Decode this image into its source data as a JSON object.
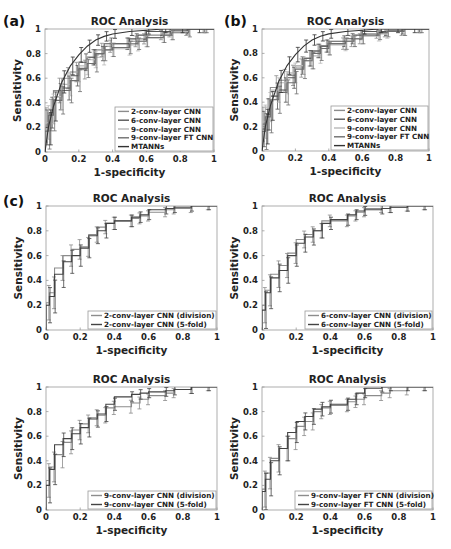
{
  "figure": {
    "panel_labels": [
      "(a)",
      "(b)",
      "(c)"
    ]
  },
  "chart_data": [
    {
      "id": "a",
      "panel_label": "(a)",
      "type": "line",
      "title": "ROC Analysis",
      "xlabel": "1-specificity",
      "ylabel": "Sensitivity",
      "xlim": [
        0,
        1
      ],
      "ylim": [
        0,
        1
      ],
      "xticks": [
        "0",
        "0.2",
        "0.4",
        "0.6",
        "0.8",
        "1"
      ],
      "yticks": [
        "0",
        "0.2",
        "0.4",
        "0.6",
        "0.8",
        "1"
      ],
      "grid": false,
      "legend_position": "lower right",
      "frame": {
        "x0": 45,
        "y0": 29,
        "x1": 214,
        "y1": 152
      },
      "legend_box": {
        "x": 115,
        "y": 107,
        "w": 98,
        "h": 44
      },
      "series": [
        {
          "name": "2-conv-layer CNN",
          "color": "#8c8c8c",
          "step": true,
          "x": [
            0,
            0.02,
            0.05,
            0.1,
            0.15,
            0.2,
            0.25,
            0.3,
            0.35,
            0.4,
            0.5,
            0.55,
            0.6,
            0.7,
            0.75,
            0.85,
            0.95,
            1
          ],
          "y": [
            0,
            0.22,
            0.3,
            0.5,
            0.6,
            0.65,
            0.67,
            0.77,
            0.83,
            0.86,
            0.88,
            0.9,
            0.92,
            0.95,
            0.97,
            0.98,
            1,
            1
          ]
        },
        {
          "name": "6-conv-layer CNN",
          "color": "#555555",
          "step": true,
          "x": [
            0,
            0.02,
            0.05,
            0.1,
            0.15,
            0.2,
            0.25,
            0.3,
            0.35,
            0.4,
            0.5,
            0.55,
            0.6,
            0.7,
            0.75,
            0.85,
            0.95,
            1
          ],
          "y": [
            0,
            0.2,
            0.32,
            0.45,
            0.52,
            0.62,
            0.73,
            0.77,
            0.8,
            0.88,
            0.88,
            0.92,
            0.95,
            0.98,
            0.98,
            0.99,
            1,
            1
          ]
        },
        {
          "name": "9-conv-layer CNN",
          "color": "#b8b8b8",
          "step": true,
          "x": [
            0,
            0.02,
            0.05,
            0.1,
            0.15,
            0.2,
            0.25,
            0.3,
            0.35,
            0.4,
            0.5,
            0.55,
            0.6,
            0.7,
            0.75,
            0.85,
            0.95,
            1
          ],
          "y": [
            0,
            0.24,
            0.35,
            0.45,
            0.55,
            0.65,
            0.7,
            0.75,
            0.77,
            0.83,
            0.84,
            0.87,
            0.9,
            0.93,
            0.95,
            0.98,
            1,
            1
          ]
        },
        {
          "name": "9-conv-layer FT CNN",
          "color": "#6e6e6e",
          "step": true,
          "x": [
            0,
            0.02,
            0.05,
            0.1,
            0.15,
            0.2,
            0.25,
            0.3,
            0.35,
            0.4,
            0.5,
            0.55,
            0.6,
            0.7,
            0.75,
            0.85,
            0.95,
            1
          ],
          "y": [
            0,
            0.17,
            0.3,
            0.42,
            0.5,
            0.58,
            0.68,
            0.72,
            0.8,
            0.83,
            0.85,
            0.88,
            0.9,
            0.93,
            0.95,
            0.97,
            1,
            1
          ]
        },
        {
          "name": "MTANNs",
          "color": "#333333",
          "step": false,
          "x": [
            0,
            0.02,
            0.05,
            0.1,
            0.15,
            0.2,
            0.25,
            0.3,
            0.35,
            0.4,
            0.5,
            0.6,
            0.7,
            0.8,
            0.9,
            1
          ],
          "y": [
            0,
            0.2,
            0.37,
            0.57,
            0.7,
            0.79,
            0.86,
            0.91,
            0.94,
            0.96,
            0.98,
            0.99,
            1,
            1,
            1,
            1
          ]
        }
      ]
    },
    {
      "id": "b",
      "panel_label": "(b)",
      "type": "line",
      "title": "ROC Analysis",
      "xlabel": "1-specificity",
      "ylabel": "Sensitivity",
      "xlim": [
        0,
        1
      ],
      "ylim": [
        0,
        1
      ],
      "xticks": [
        "0",
        "0.2",
        "0.4",
        "0.6",
        "0.8",
        "1"
      ],
      "yticks": [
        "0",
        "0.2",
        "0.4",
        "0.6",
        "0.8",
        "1"
      ],
      "grid": false,
      "legend_position": "lower right",
      "frame": {
        "x0": 262,
        "y0": 29,
        "x1": 429,
        "y1": 151
      },
      "legend_box": {
        "x": 331,
        "y": 106,
        "w": 97,
        "h": 44
      },
      "series": [
        {
          "name": "2-conv-layer CNN",
          "color": "#8c8c8c",
          "step": true,
          "x": [
            0,
            0.02,
            0.05,
            0.1,
            0.15,
            0.2,
            0.25,
            0.3,
            0.35,
            0.4,
            0.5,
            0.55,
            0.6,
            0.7,
            0.75,
            0.85,
            0.95,
            1
          ],
          "y": [
            0,
            0.22,
            0.3,
            0.52,
            0.58,
            0.62,
            0.68,
            0.76,
            0.82,
            0.86,
            0.88,
            0.9,
            0.92,
            0.96,
            0.97,
            0.98,
            1,
            1
          ]
        },
        {
          "name": "6-conv-layer CNN",
          "color": "#555555",
          "step": true,
          "x": [
            0,
            0.02,
            0.05,
            0.1,
            0.15,
            0.2,
            0.25,
            0.3,
            0.35,
            0.4,
            0.5,
            0.55,
            0.6,
            0.7,
            0.75,
            0.85,
            0.95,
            1
          ],
          "y": [
            0,
            0.18,
            0.3,
            0.45,
            0.5,
            0.6,
            0.7,
            0.76,
            0.82,
            0.86,
            0.9,
            0.92,
            0.95,
            0.98,
            0.98,
            0.99,
            1,
            1
          ]
        },
        {
          "name": "9-conv-layer CNN",
          "color": "#b8b8b8",
          "step": true,
          "x": [
            0,
            0.02,
            0.05,
            0.1,
            0.15,
            0.2,
            0.25,
            0.3,
            0.35,
            0.4,
            0.5,
            0.55,
            0.6,
            0.7,
            0.75,
            0.85,
            0.95,
            1
          ],
          "y": [
            0,
            0.24,
            0.36,
            0.5,
            0.56,
            0.64,
            0.7,
            0.74,
            0.78,
            0.84,
            0.87,
            0.9,
            0.92,
            0.94,
            0.96,
            0.98,
            1,
            1
          ]
        },
        {
          "name": "9-conv-layer FT CNN",
          "color": "#6e6e6e",
          "step": true,
          "x": [
            0,
            0.02,
            0.05,
            0.1,
            0.15,
            0.2,
            0.25,
            0.3,
            0.35,
            0.4,
            0.5,
            0.55,
            0.6,
            0.7,
            0.75,
            0.85,
            0.95,
            1
          ],
          "y": [
            0,
            0.16,
            0.28,
            0.42,
            0.48,
            0.56,
            0.67,
            0.74,
            0.8,
            0.84,
            0.88,
            0.9,
            0.92,
            0.95,
            0.97,
            0.98,
            1,
            1
          ]
        },
        {
          "name": "MTANNs",
          "color": "#333333",
          "step": false,
          "x": [
            0,
            0.02,
            0.05,
            0.1,
            0.15,
            0.2,
            0.25,
            0.3,
            0.35,
            0.4,
            0.5,
            0.6,
            0.7,
            0.8,
            0.9,
            1
          ],
          "y": [
            0,
            0.2,
            0.37,
            0.57,
            0.7,
            0.79,
            0.86,
            0.91,
            0.94,
            0.96,
            0.98,
            0.99,
            1,
            1,
            1,
            1
          ]
        }
      ]
    },
    {
      "id": "c1",
      "panel_label": "(c)",
      "type": "line",
      "title": "ROC Analysis",
      "xlabel": "1-specificity",
      "ylabel": "Sensitivity",
      "xlim": [
        0,
        1
      ],
      "ylim": [
        0,
        1
      ],
      "xticks": [
        "0",
        "0.2",
        "0.4",
        "0.6",
        "0.8",
        "1"
      ],
      "yticks": [
        "0",
        "0.2",
        "0.4",
        "0.6",
        "0.8",
        "1"
      ],
      "grid": false,
      "legend_position": "lower right",
      "frame": {
        "x0": 46,
        "y0": 206,
        "x1": 217,
        "y1": 330
      },
      "legend_box": {
        "x": 88,
        "y": 311,
        "w": 128,
        "h": 18
      },
      "series": [
        {
          "name": "2-conv-layer CNN (division)",
          "color": "#8c8c8c",
          "step": true,
          "x": [
            0,
            0.02,
            0.05,
            0.1,
            0.15,
            0.2,
            0.25,
            0.3,
            0.35,
            0.4,
            0.5,
            0.55,
            0.6,
            0.7,
            0.75,
            0.85,
            0.95,
            1
          ],
          "y": [
            0,
            0.22,
            0.3,
            0.5,
            0.6,
            0.65,
            0.67,
            0.77,
            0.83,
            0.86,
            0.88,
            0.9,
            0.92,
            0.95,
            0.97,
            0.98,
            1,
            1
          ]
        },
        {
          "name": "2-conv-layer CNN (5-fold)",
          "color": "#444444",
          "step": true,
          "x": [
            0,
            0.02,
            0.05,
            0.1,
            0.15,
            0.2,
            0.25,
            0.3,
            0.35,
            0.4,
            0.5,
            0.55,
            0.6,
            0.7,
            0.75,
            0.85,
            0.95,
            1
          ],
          "y": [
            0,
            0.2,
            0.27,
            0.45,
            0.55,
            0.6,
            0.66,
            0.76,
            0.8,
            0.86,
            0.88,
            0.91,
            0.93,
            0.97,
            0.98,
            0.99,
            1,
            1
          ]
        }
      ]
    },
    {
      "id": "c2",
      "panel_label": "",
      "type": "line",
      "title": "ROC Analysis",
      "xlabel": "1-specificity",
      "ylabel": "Sensitivity",
      "xlim": [
        0,
        1
      ],
      "ylim": [
        0,
        1
      ],
      "xticks": [
        "0",
        "0.2",
        "0.4",
        "0.6",
        "0.8",
        "1"
      ],
      "yticks": [
        "0",
        "0.2",
        "0.4",
        "0.6",
        "0.8",
        "1"
      ],
      "grid": false,
      "legend_position": "lower right",
      "frame": {
        "x0": 262,
        "y0": 206,
        "x1": 433,
        "y1": 330
      },
      "legend_box": {
        "x": 305,
        "y": 311,
        "w": 127,
        "h": 18
      },
      "series": [
        {
          "name": "6-conv-layer CNN (division)",
          "color": "#8c8c8c",
          "step": true,
          "x": [
            0,
            0.02,
            0.05,
            0.1,
            0.15,
            0.2,
            0.25,
            0.3,
            0.35,
            0.4,
            0.5,
            0.55,
            0.6,
            0.7,
            0.75,
            0.85,
            0.95,
            1
          ],
          "y": [
            0,
            0.2,
            0.32,
            0.45,
            0.52,
            0.62,
            0.73,
            0.77,
            0.8,
            0.88,
            0.88,
            0.92,
            0.95,
            0.98,
            0.98,
            0.99,
            1,
            1
          ]
        },
        {
          "name": "6-conv-layer CNN (5-fold)",
          "color": "#444444",
          "step": true,
          "x": [
            0,
            0.02,
            0.05,
            0.1,
            0.15,
            0.2,
            0.25,
            0.3,
            0.35,
            0.4,
            0.5,
            0.55,
            0.6,
            0.7,
            0.75,
            0.85,
            0.95,
            1
          ],
          "y": [
            0,
            0.16,
            0.3,
            0.42,
            0.48,
            0.6,
            0.7,
            0.75,
            0.8,
            0.86,
            0.89,
            0.93,
            0.96,
            0.97,
            0.98,
            0.99,
            1,
            1
          ]
        }
      ]
    },
    {
      "id": "c3",
      "panel_label": "",
      "type": "line",
      "title": "ROC Analysis",
      "xlabel": "1-specificity",
      "ylabel": "Sensitivity",
      "xlim": [
        0,
        1
      ],
      "ylim": [
        0,
        1
      ],
      "xticks": [
        "0",
        "0.2",
        "0.4",
        "0.6",
        "0.8",
        "1"
      ],
      "yticks": [
        "0",
        "0.2",
        "0.4",
        "0.6",
        "0.8",
        "1"
      ],
      "grid": false,
      "legend_position": "lower right",
      "frame": {
        "x0": 46,
        "y0": 387,
        "x1": 217,
        "y1": 510
      },
      "legend_box": {
        "x": 88,
        "y": 491,
        "w": 128,
        "h": 18
      },
      "series": [
        {
          "name": "9-conv-layer CNN (division)",
          "color": "#8c8c8c",
          "step": true,
          "x": [
            0,
            0.02,
            0.05,
            0.1,
            0.15,
            0.2,
            0.25,
            0.3,
            0.35,
            0.4,
            0.5,
            0.55,
            0.6,
            0.7,
            0.75,
            0.85,
            0.95,
            1
          ],
          "y": [
            0,
            0.24,
            0.35,
            0.45,
            0.55,
            0.65,
            0.7,
            0.75,
            0.77,
            0.83,
            0.84,
            0.87,
            0.9,
            0.93,
            0.95,
            0.98,
            1,
            1
          ]
        },
        {
          "name": "9-conv-layer CNN (5-fold)",
          "color": "#444444",
          "step": true,
          "x": [
            0,
            0.02,
            0.05,
            0.1,
            0.15,
            0.2,
            0.25,
            0.3,
            0.35,
            0.4,
            0.5,
            0.55,
            0.6,
            0.7,
            0.75,
            0.85,
            0.95,
            1
          ],
          "y": [
            0,
            0.2,
            0.33,
            0.53,
            0.58,
            0.62,
            0.67,
            0.74,
            0.78,
            0.86,
            0.92,
            0.94,
            0.95,
            0.96,
            0.97,
            0.98,
            1,
            1
          ]
        }
      ]
    },
    {
      "id": "c4",
      "panel_label": "",
      "type": "line",
      "title": "ROC Analysis",
      "xlabel": "1-specificity",
      "ylabel": "Sensitivity",
      "xlim": [
        0,
        1
      ],
      "ylim": [
        0,
        1
      ],
      "xticks": [
        "0",
        "0.2",
        "0.4",
        "0.6",
        "0.8",
        "1"
      ],
      "yticks": [
        "0",
        "0.2",
        "0.4",
        "0.6",
        "0.8",
        "1"
      ],
      "grid": false,
      "legend_position": "lower right",
      "frame": {
        "x0": 262,
        "y0": 387,
        "x1": 433,
        "y1": 510
      },
      "legend_box": {
        "x": 295,
        "y": 491,
        "w": 137,
        "h": 18
      },
      "series": [
        {
          "name": "9-conv-layer FT CNN (division)",
          "color": "#8c8c8c",
          "step": true,
          "x": [
            0,
            0.02,
            0.05,
            0.1,
            0.15,
            0.2,
            0.25,
            0.3,
            0.35,
            0.4,
            0.5,
            0.55,
            0.6,
            0.7,
            0.75,
            0.85,
            0.95,
            1
          ],
          "y": [
            0,
            0.17,
            0.3,
            0.42,
            0.5,
            0.58,
            0.68,
            0.72,
            0.8,
            0.83,
            0.85,
            0.88,
            0.9,
            0.93,
            0.95,
            0.97,
            1,
            1
          ]
        },
        {
          "name": "9-conv-layer FT CNN (5-fold)",
          "color": "#444444",
          "step": true,
          "x": [
            0,
            0.02,
            0.05,
            0.1,
            0.15,
            0.2,
            0.25,
            0.3,
            0.35,
            0.4,
            0.5,
            0.55,
            0.6,
            0.7,
            0.75,
            0.85,
            0.95,
            1
          ],
          "y": [
            0,
            0.15,
            0.25,
            0.4,
            0.5,
            0.63,
            0.72,
            0.76,
            0.82,
            0.84,
            0.86,
            0.9,
            0.95,
            0.99,
            1,
            1,
            1,
            1
          ]
        }
      ]
    }
  ],
  "style": {
    "frame_color": "#9a9a9a",
    "text_color": "#222222",
    "errorbar_color": "#555555",
    "background": "#ffffff"
  }
}
